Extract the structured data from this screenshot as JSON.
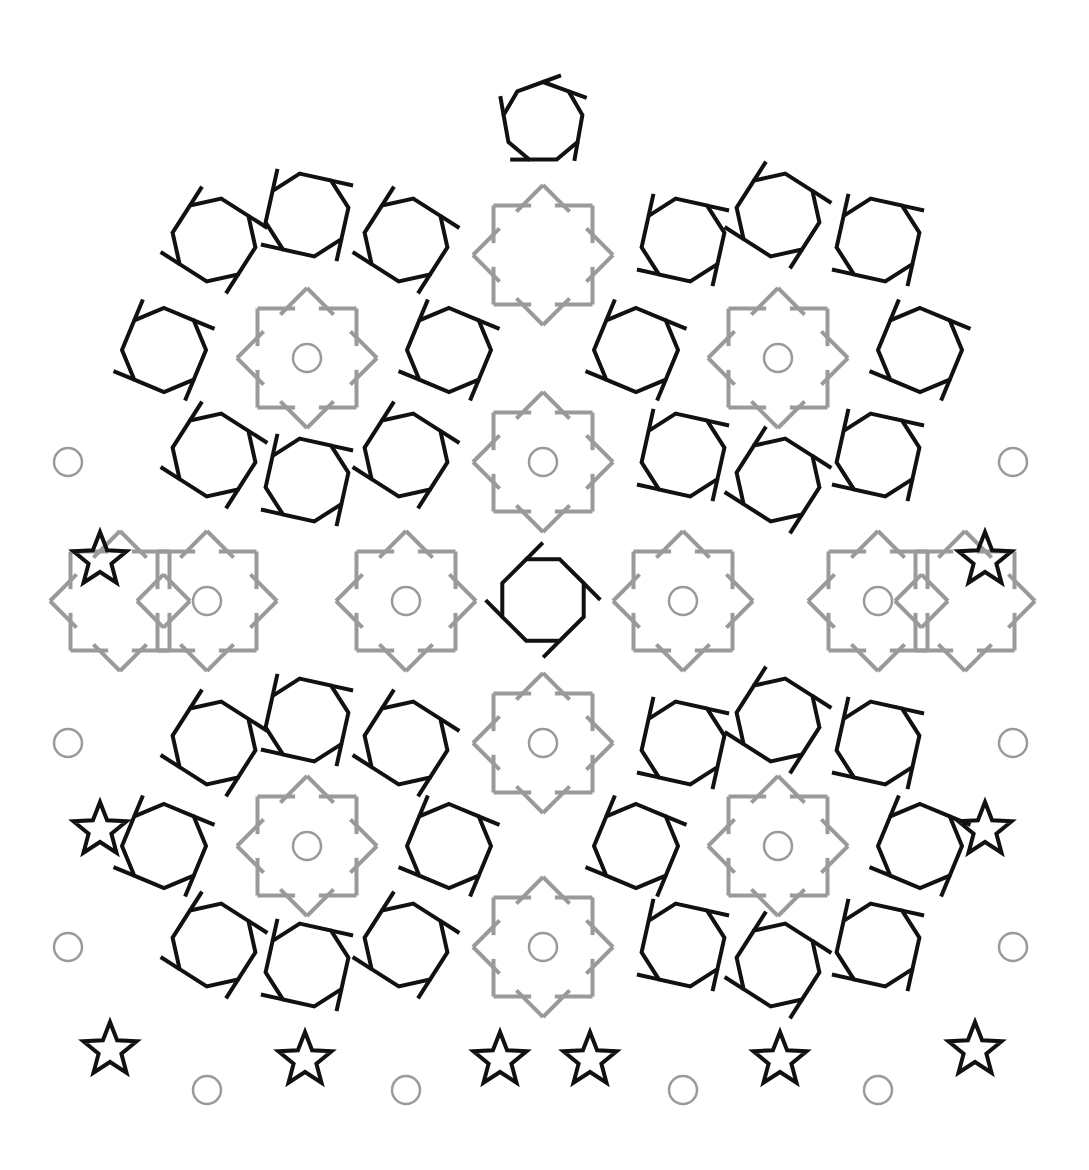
{
  "figure": {
    "colors": {
      "background": "#ffffff",
      "black_line": "#111111",
      "gray_line": "#9a9a9a"
    },
    "stroke": {
      "black": 4,
      "gray": 4
    },
    "top_polygon": {
      "cx": 543,
      "cy": 122,
      "r": 40,
      "sides": 9
    },
    "black_polygons": [
      {
        "cx": 214,
        "cy": 240,
        "r": 42,
        "sides": 8,
        "rot": 10
      },
      {
        "cx": 307,
        "cy": 215,
        "r": 42,
        "sides": 8,
        "rot": -10
      },
      {
        "cx": 406,
        "cy": 240,
        "r": 42,
        "sides": 8,
        "rot": 10
      },
      {
        "cx": 683,
        "cy": 240,
        "r": 42,
        "sides": 8,
        "rot": -10
      },
      {
        "cx": 778,
        "cy": 215,
        "r": 42,
        "sides": 8,
        "rot": 10
      },
      {
        "cx": 878,
        "cy": 240,
        "r": 42,
        "sides": 8,
        "rot": -10
      },
      {
        "cx": 164,
        "cy": 350,
        "r": 42,
        "sides": 8,
        "rot": 0
      },
      {
        "cx": 449,
        "cy": 350,
        "r": 42,
        "sides": 8,
        "rot": 0
      },
      {
        "cx": 636,
        "cy": 350,
        "r": 42,
        "sides": 8,
        "rot": 0
      },
      {
        "cx": 920,
        "cy": 350,
        "r": 42,
        "sides": 8,
        "rot": 0
      },
      {
        "cx": 214,
        "cy": 455,
        "r": 42,
        "sides": 8,
        "rot": 10
      },
      {
        "cx": 307,
        "cy": 480,
        "r": 42,
        "sides": 8,
        "rot": -10
      },
      {
        "cx": 406,
        "cy": 455,
        "r": 42,
        "sides": 8,
        "rot": 10
      },
      {
        "cx": 683,
        "cy": 455,
        "r": 42,
        "sides": 8,
        "rot": -10
      },
      {
        "cx": 778,
        "cy": 480,
        "r": 42,
        "sides": 8,
        "rot": 10
      },
      {
        "cx": 878,
        "cy": 455,
        "r": 42,
        "sides": 8,
        "rot": -10
      },
      {
        "cx": 543,
        "cy": 600,
        "r": 44,
        "sides": 8,
        "rot": 22.5
      },
      {
        "cx": 214,
        "cy": 743,
        "r": 42,
        "sides": 8,
        "rot": 10
      },
      {
        "cx": 307,
        "cy": 720,
        "r": 42,
        "sides": 8,
        "rot": -10
      },
      {
        "cx": 406,
        "cy": 743,
        "r": 42,
        "sides": 8,
        "rot": 10
      },
      {
        "cx": 683,
        "cy": 743,
        "r": 42,
        "sides": 8,
        "rot": -10
      },
      {
        "cx": 778,
        "cy": 720,
        "r": 42,
        "sides": 8,
        "rot": 10
      },
      {
        "cx": 878,
        "cy": 743,
        "r": 42,
        "sides": 8,
        "rot": -10
      },
      {
        "cx": 164,
        "cy": 846,
        "r": 42,
        "sides": 8,
        "rot": 0
      },
      {
        "cx": 449,
        "cy": 846,
        "r": 42,
        "sides": 8,
        "rot": 0
      },
      {
        "cx": 636,
        "cy": 846,
        "r": 42,
        "sides": 8,
        "rot": 0
      },
      {
        "cx": 920,
        "cy": 846,
        "r": 42,
        "sides": 8,
        "rot": 0
      },
      {
        "cx": 214,
        "cy": 945,
        "r": 42,
        "sides": 8,
        "rot": 10
      },
      {
        "cx": 307,
        "cy": 965,
        "r": 42,
        "sides": 8,
        "rot": -10
      },
      {
        "cx": 406,
        "cy": 945,
        "r": 42,
        "sides": 8,
        "rot": 10
      },
      {
        "cx": 683,
        "cy": 945,
        "r": 42,
        "sides": 8,
        "rot": -10
      },
      {
        "cx": 778,
        "cy": 965,
        "r": 42,
        "sides": 8,
        "rot": 10
      },
      {
        "cx": 878,
        "cy": 945,
        "r": 42,
        "sides": 8,
        "rot": -10
      }
    ],
    "star_rosettes": [
      {
        "cx": 543,
        "cy": 255
      },
      {
        "cx": 307,
        "cy": 358
      },
      {
        "cx": 778,
        "cy": 358
      },
      {
        "cx": 543,
        "cy": 462
      },
      {
        "cx": 207,
        "cy": 601
      },
      {
        "cx": 406,
        "cy": 601
      },
      {
        "cx": 683,
        "cy": 601
      },
      {
        "cx": 878,
        "cy": 601
      },
      {
        "cx": 543,
        "cy": 743
      },
      {
        "cx": 307,
        "cy": 846
      },
      {
        "cx": 778,
        "cy": 846
      },
      {
        "cx": 543,
        "cy": 947
      },
      {
        "cx": 120,
        "cy": 601
      },
      {
        "cx": 965,
        "cy": 601
      }
    ],
    "gray_circles": [
      {
        "cx": 307,
        "cy": 358
      },
      {
        "cx": 778,
        "cy": 358
      },
      {
        "cx": 68,
        "cy": 462
      },
      {
        "cx": 543,
        "cy": 462
      },
      {
        "cx": 1013,
        "cy": 462
      },
      {
        "cx": 207,
        "cy": 601
      },
      {
        "cx": 406,
        "cy": 601
      },
      {
        "cx": 683,
        "cy": 601
      },
      {
        "cx": 878,
        "cy": 601
      },
      {
        "cx": 68,
        "cy": 743
      },
      {
        "cx": 543,
        "cy": 743
      },
      {
        "cx": 1013,
        "cy": 743
      },
      {
        "cx": 307,
        "cy": 846
      },
      {
        "cx": 778,
        "cy": 846
      },
      {
        "cx": 68,
        "cy": 947
      },
      {
        "cx": 543,
        "cy": 947
      },
      {
        "cx": 1013,
        "cy": 947
      },
      {
        "cx": 207,
        "cy": 1090
      },
      {
        "cx": 406,
        "cy": 1090
      },
      {
        "cx": 683,
        "cy": 1090
      },
      {
        "cx": 878,
        "cy": 1090
      }
    ],
    "circle_radius": 14,
    "edge_stars_black": [
      {
        "cx": 100,
        "cy": 560
      },
      {
        "cx": 100,
        "cy": 830
      },
      {
        "cx": 110,
        "cy": 1050
      },
      {
        "cx": 985,
        "cy": 560
      },
      {
        "cx": 985,
        "cy": 830
      },
      {
        "cx": 975,
        "cy": 1050
      },
      {
        "cx": 305,
        "cy": 1060
      },
      {
        "cx": 500,
        "cy": 1060
      },
      {
        "cx": 590,
        "cy": 1060
      },
      {
        "cx": 780,
        "cy": 1060
      }
    ]
  }
}
